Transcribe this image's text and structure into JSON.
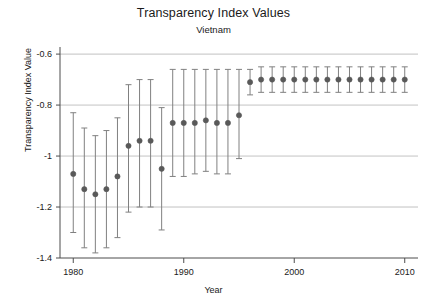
{
  "chart_data": {
    "type": "scatter",
    "title": "Transparency Index Values",
    "subtitle": "Vietnam",
    "xlabel": "Year",
    "ylabel": "Transparency Index Value",
    "xlim": [
      1978.8,
      2011.2
    ],
    "ylim": [
      -1.4,
      -0.58
    ],
    "xticks": [
      1980,
      1990,
      2000,
      2010
    ],
    "xticklabels": [
      "1980",
      "1990",
      "2000",
      "2010"
    ],
    "yticks": [
      -0.6,
      -0.8,
      -1.0,
      -1.2,
      -1.4
    ],
    "yticklabels": [
      "-0.6",
      "-0.8",
      "-1",
      "-1.2",
      "-1.4"
    ],
    "grid": "horizontal",
    "legend": "none",
    "marker": "circle-with-error-bars",
    "marker_color": "#595959",
    "errorbar_color": "#808080",
    "grid_color": "#b3b3b3",
    "axis_color": "#4d4d4d",
    "x": [
      1980,
      1981,
      1982,
      1983,
      1984,
      1985,
      1986,
      1987,
      1988,
      1989,
      1990,
      1991,
      1992,
      1993,
      1994,
      1995,
      1996,
      1997,
      1998,
      1999,
      2000,
      2001,
      2002,
      2003,
      2004,
      2005,
      2006,
      2007,
      2008,
      2009,
      2010
    ],
    "values": [
      -1.07,
      -1.13,
      -1.15,
      -1.13,
      -1.08,
      -0.96,
      -0.94,
      -0.94,
      -1.05,
      -0.87,
      -0.87,
      -0.87,
      -0.86,
      -0.87,
      -0.87,
      -0.84,
      -0.71,
      -0.7,
      -0.7,
      -0.7,
      -0.7,
      -0.7,
      -0.7,
      -0.7,
      -0.7,
      -0.7,
      -0.7,
      -0.7,
      -0.7,
      -0.7,
      -0.7
    ],
    "ci_low": [
      -1.3,
      -1.36,
      -1.38,
      -1.36,
      -1.32,
      -1.22,
      -1.2,
      -1.2,
      -1.29,
      -1.08,
      -1.08,
      -1.07,
      -1.06,
      -1.07,
      -1.07,
      -1.01,
      -0.76,
      -0.75,
      -0.75,
      -0.75,
      -0.75,
      -0.75,
      -0.75,
      -0.75,
      -0.75,
      -0.75,
      -0.75,
      -0.75,
      -0.75,
      -0.75,
      -0.75
    ],
    "ci_high": [
      -0.83,
      -0.89,
      -0.92,
      -0.9,
      -0.85,
      -0.72,
      -0.7,
      -0.7,
      -0.81,
      -0.66,
      -0.66,
      -0.66,
      -0.66,
      -0.66,
      -0.66,
      -0.66,
      -0.66,
      -0.65,
      -0.65,
      -0.65,
      -0.65,
      -0.65,
      -0.65,
      -0.65,
      -0.65,
      -0.65,
      -0.65,
      -0.65,
      -0.65,
      -0.65,
      -0.65
    ]
  }
}
